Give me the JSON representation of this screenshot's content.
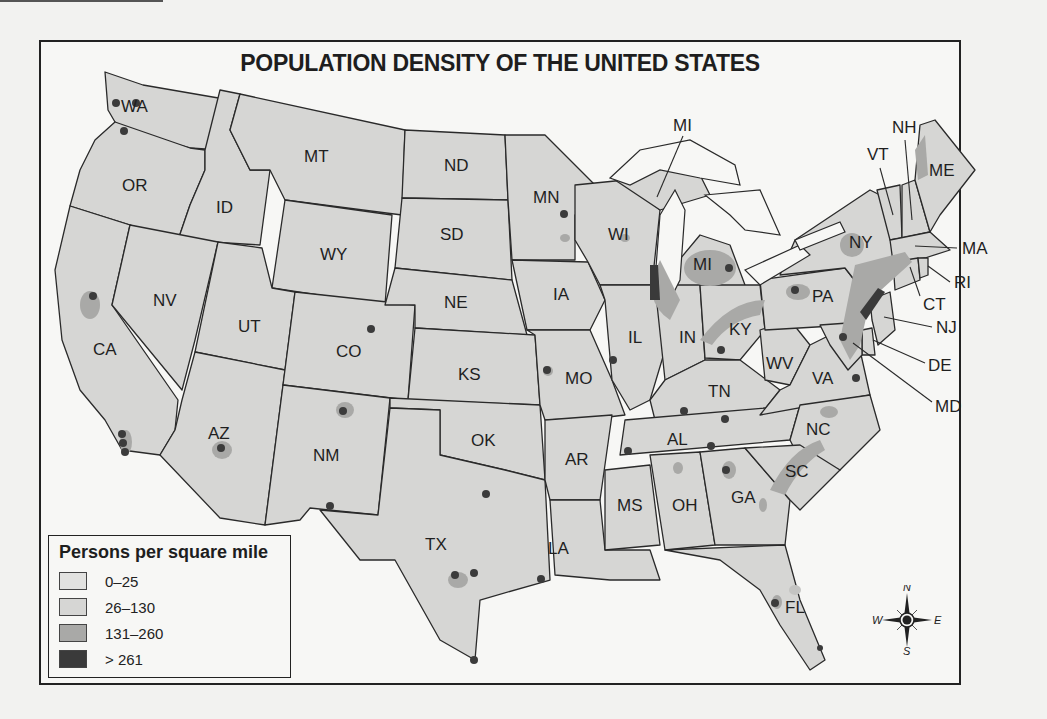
{
  "map": {
    "title": "POPULATION DENSITY OF THE UNITED STATES",
    "legend": {
      "title": "Persons per square mile",
      "items": [
        {
          "label": "0–25",
          "color": "#e2e2e0"
        },
        {
          "label": "26–130",
          "color": "#d6d6d4"
        },
        {
          "label": "131–260",
          "color": "#a9a9a7"
        },
        {
          "label": "> 261",
          "color": "#3a3a3a"
        }
      ]
    },
    "compass": {
      "n": "N",
      "s": "S",
      "e": "E",
      "w": "W"
    },
    "state_labels": [
      "WA",
      "OR",
      "CA",
      "ID",
      "NV",
      "MT",
      "WY",
      "UT",
      "AZ",
      "CO",
      "NM",
      "ND",
      "SD",
      "NE",
      "KS",
      "OK",
      "TX",
      "MN",
      "IA",
      "MO",
      "AR",
      "LA",
      "WI",
      "IL",
      "MS",
      "MI",
      "IN",
      "KY",
      "TN",
      "AL",
      "OH",
      "WV",
      "GA",
      "FL",
      "PA",
      "VA",
      "NC",
      "SC",
      "NY",
      "VT",
      "NH",
      "ME",
      "MA",
      "RI",
      "CT",
      "NJ",
      "DE",
      "MD"
    ],
    "callout_labels": {
      "mi_upper": "MI",
      "vt": "VT",
      "nh": "NH",
      "me": "ME",
      "ma": "MA",
      "ri": "RI",
      "ct": "CT",
      "nj": "NJ",
      "de": "DE",
      "md": "MD"
    }
  }
}
